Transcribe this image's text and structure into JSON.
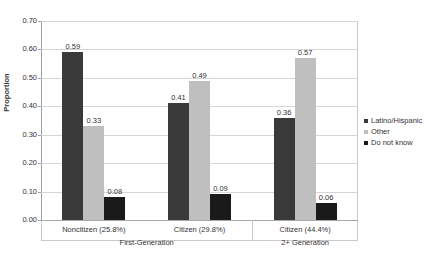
{
  "chart_data": {
    "type": "bar",
    "title": "",
    "xlabel": "",
    "ylabel": "Proportion",
    "ylim": [
      0.0,
      0.7
    ],
    "ytick_labels": [
      "0.00",
      "0.10",
      "0.20",
      "0.30",
      "0.40",
      "0.50",
      "0.60",
      "0.70"
    ],
    "ytick_values": [
      0.0,
      0.1,
      0.2,
      0.3,
      0.4,
      0.5,
      0.6,
      0.7
    ],
    "grid": true,
    "legend_position": "right",
    "categories": [
      "Noncitizen (25.8%)",
      "Citizen (29.8%)",
      "Citizen (44.4%)"
    ],
    "group_labels": [
      "First-Generation",
      "2+ Generation"
    ],
    "group_spans": [
      2,
      1
    ],
    "series": [
      {
        "name": "Latino/Hispanic",
        "color": "#3a3a3a",
        "values": [
          0.59,
          0.41,
          0.36
        ],
        "labels": [
          "0.59",
          "0.41",
          "0.36"
        ]
      },
      {
        "name": "Other",
        "color": "#bfbfbf",
        "values": [
          0.33,
          0.49,
          0.57
        ],
        "labels": [
          "0.33",
          "0.49",
          "0.57"
        ]
      },
      {
        "name": "Do not know",
        "color": "#1a1a1a",
        "values": [
          0.08,
          0.09,
          0.06
        ],
        "labels": [
          "0.08",
          "0.09",
          "0.06"
        ]
      }
    ]
  }
}
